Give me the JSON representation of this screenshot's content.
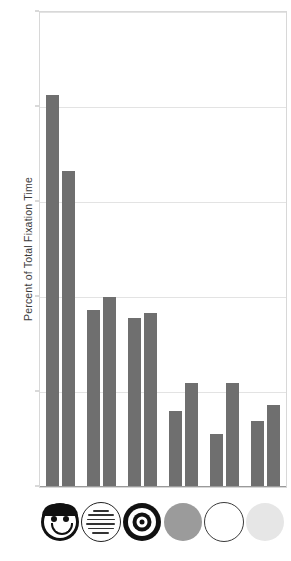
{
  "chart_data": {
    "type": "bar",
    "title": "",
    "xlabel": "",
    "ylabel": "Percent of Total Fixation Time",
    "ylim": [
      0,
      50
    ],
    "yticks": [
      0,
      10,
      20,
      30,
      40,
      50
    ],
    "ytick_labels": [
      "0",
      "10",
      "20",
      "30",
      "40",
      "50"
    ],
    "grid": "horizontal",
    "legend": "none",
    "grouped": true,
    "bars_per_group": 2,
    "categories": [
      "face-icon",
      "text-circle-icon",
      "bullseye-icon",
      "gray-disc-icon",
      "white-disc-icon",
      "light-gray-disc-icon"
    ],
    "series": [
      {
        "name": "bar-a",
        "values": [
          41.3,
          18.6,
          17.8,
          8.0,
          5.6,
          7.0
        ]
      },
      {
        "name": "bar-b",
        "values": [
          33.3,
          20.0,
          18.3,
          11.0,
          11.0,
          8.6
        ]
      }
    ],
    "bar_color": "#6f6f6f",
    "gridline_color": "#e3e3e3",
    "frame_color": "#d8d8d8",
    "background": "#ffffff"
  },
  "icons": {
    "face": {
      "name": "smiley-face-icon",
      "fill": "#111111"
    },
    "text_circle": {
      "name": "text-circle-icon",
      "fill": "#ffffff",
      "line_count": 6
    },
    "bullseye": {
      "name": "bullseye-icon",
      "fill": "#111111",
      "rings": 3
    },
    "gray_disc": {
      "name": "gray-disc-icon",
      "fill": "#9b9b9b"
    },
    "white_disc": {
      "name": "white-disc-icon",
      "fill": "#ffffff"
    },
    "light_disc": {
      "name": "light-gray-disc-icon",
      "fill": "#e6e6e6"
    }
  }
}
